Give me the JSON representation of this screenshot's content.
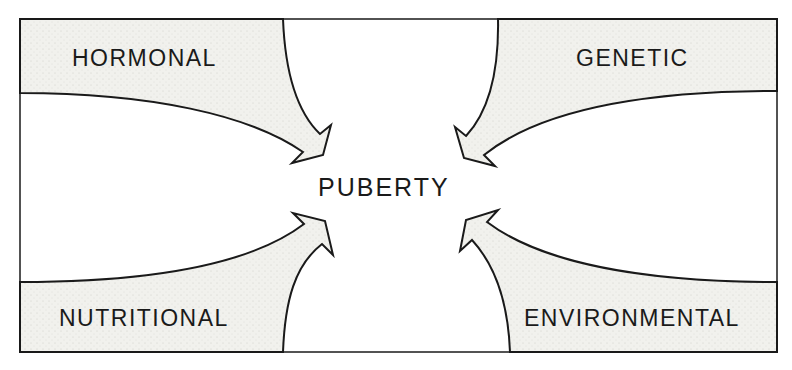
{
  "diagram": {
    "center": "PUBERTY",
    "factors": [
      {
        "label": "HORMONAL",
        "position": "top-left"
      },
      {
        "label": "GENETIC",
        "position": "top-right"
      },
      {
        "label": "NUTRITIONAL",
        "position": "bottom-left"
      },
      {
        "label": "ENVIRONMENTAL",
        "position": "bottom-right"
      }
    ],
    "colors": {
      "line": "#1a1a1a",
      "shade": "#eeeeea",
      "background": "#ffffff"
    }
  }
}
